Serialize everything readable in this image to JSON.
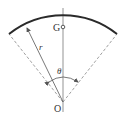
{
  "diagram": {
    "labels": {
      "centroid": "G",
      "center": "O",
      "radius": "r",
      "angle": "θ"
    },
    "colors": {
      "arc": "#2a2a2a",
      "lines": "#555555",
      "dashed": "#888888"
    }
  }
}
